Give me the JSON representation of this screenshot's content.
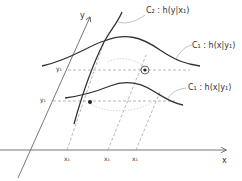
{
  "diagram": {
    "type": "conditional-distribution-curves",
    "axes": {
      "x_label": "x",
      "y_label": "y"
    },
    "curves": [
      {
        "id": "C2",
        "label": "C₂ : h(y|x₁)"
      },
      {
        "id": "C1_upper",
        "label": "C₁ : h(x|y₁)"
      },
      {
        "id": "C1_lower",
        "label": "C₁ : h(x|y₁)"
      }
    ],
    "y_ticks": [
      {
        "id": "y1_upper",
        "label": "y₁"
      },
      {
        "id": "y1_lower",
        "label": "y₁"
      }
    ],
    "x_ticks": [
      {
        "id": "x1_a",
        "label": "x₁"
      },
      {
        "id": "x1_b",
        "label": "x₁"
      },
      {
        "id": "x1_c",
        "label": "x₁"
      }
    ],
    "colors": {
      "curve": "#333333",
      "axis": "#555555",
      "dashed": "#999999",
      "dotted": "#cccccc"
    }
  }
}
